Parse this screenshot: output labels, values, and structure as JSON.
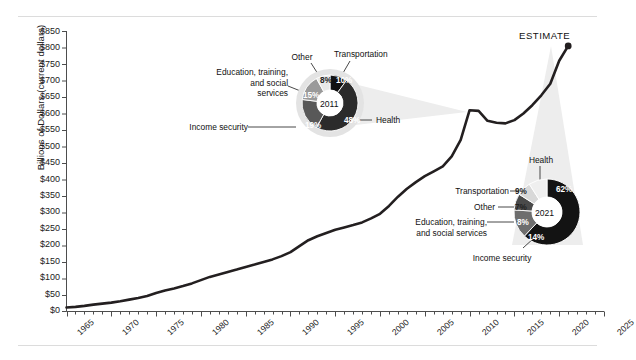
{
  "chart_data": {
    "type": "line",
    "title": "",
    "xlabel": "",
    "ylabel": "Billions of Dollars (current dollars)",
    "xlim": [
      1965,
      2025
    ],
    "ylim": [
      0,
      850
    ],
    "ytick_labels": [
      "$850",
      "$800",
      "$750",
      "$700",
      "$650",
      "$600",
      "$550",
      "$500",
      "$450",
      "$400",
      "$350",
      "$300",
      "$250",
      "$200",
      "$150",
      "$100",
      "$50",
      "$0"
    ],
    "ytick_values": [
      850,
      800,
      750,
      700,
      650,
      600,
      550,
      500,
      450,
      400,
      350,
      300,
      250,
      200,
      150,
      100,
      50,
      0
    ],
    "xtick_labels": [
      "1965",
      "1970",
      "1975",
      "1980",
      "1985",
      "1990",
      "1995",
      "2000",
      "2005",
      "2010",
      "2015",
      "2020",
      "2025"
    ],
    "xtick_values": [
      1965,
      1970,
      1975,
      1980,
      1985,
      1990,
      1995,
      2000,
      2005,
      2010,
      2015,
      2020,
      2025
    ],
    "grid": false,
    "legend": "none",
    "series": [
      {
        "name": "Total outlays",
        "x": [
          1965,
          1966,
          1967,
          1968,
          1969,
          1970,
          1971,
          1972,
          1973,
          1974,
          1975,
          1976,
          1977,
          1978,
          1979,
          1980,
          1981,
          1982,
          1983,
          1984,
          1985,
          1986,
          1987,
          1988,
          1989,
          1990,
          1991,
          1992,
          1993,
          1994,
          1995,
          1996,
          1997,
          1998,
          1999,
          2000,
          2001,
          2002,
          2003,
          2004,
          2005,
          2006,
          2007,
          2008,
          2009,
          2010,
          2011,
          2012,
          2013,
          2014,
          2015,
          2016,
          2017,
          2018,
          2019,
          2020,
          2021
        ],
        "values": [
          12,
          14,
          17,
          21,
          24,
          27,
          31,
          36,
          41,
          47,
          56,
          64,
          70,
          77,
          85,
          95,
          105,
          112,
          120,
          127,
          135,
          142,
          150,
          158,
          168,
          180,
          198,
          216,
          228,
          238,
          248,
          255,
          262,
          270,
          282,
          296,
          320,
          348,
          372,
          392,
          410,
          425,
          440,
          470,
          520,
          610,
          608,
          578,
          572,
          570,
          580,
          600,
          625,
          655,
          690,
          760,
          805
        ]
      }
    ],
    "annotations": [
      {
        "name": "estimate-label",
        "text": "ESTIMATE"
      }
    ],
    "donuts": [
      {
        "id": "donut-2011",
        "center_label": "2011",
        "slices": [
          {
            "label": "Health",
            "pct": 48,
            "pct_text": "48%",
            "color": "#2b2b2b"
          },
          {
            "label": "Income security",
            "pct": 19,
            "pct_text": "19%",
            "color": "#585858"
          },
          {
            "label": "Education, training, and social services",
            "pct": 15,
            "pct_text": "15%",
            "color": "#9a9a9a"
          },
          {
            "label": "Other",
            "pct": 8,
            "pct_text": "8%",
            "color": "#e8e8e8"
          },
          {
            "label": "Transportation",
            "pct": 10,
            "pct_text": "10%",
            "color": "#111111"
          }
        ]
      },
      {
        "id": "donut-2021",
        "center_label": "2021",
        "slices": [
          {
            "label": "Health",
            "pct": 62,
            "pct_text": "62%",
            "color": "#131313"
          },
          {
            "label": "Income security",
            "pct": 14,
            "pct_text": "14%",
            "color": "#6e6e6e"
          },
          {
            "label": "Education, training, and social services",
            "pct": 8,
            "pct_text": "8%",
            "color": "#4a4a4a"
          },
          {
            "label": "Other",
            "pct": 7,
            "pct_text": "7%",
            "color": "#d8d8d8"
          },
          {
            "label": "Transportation",
            "pct": 9,
            "pct_text": "9%",
            "color": "#efefef"
          }
        ]
      }
    ]
  },
  "axis": {
    "ylabel": "Billions of Dollars (current dollars)",
    "yticks": [
      "$850",
      "$800",
      "$750",
      "$700",
      "$650",
      "$600",
      "$550",
      "$500",
      "$450",
      "$400",
      "$350",
      "$300",
      "$250",
      "$200",
      "$150",
      "$100",
      "$50",
      "$0"
    ],
    "xticks": [
      "1965",
      "1970",
      "1975",
      "1980",
      "1985",
      "1990",
      "1995",
      "2000",
      "2005",
      "2010",
      "2015",
      "2020",
      "2025"
    ]
  },
  "estimate": {
    "label": "ESTIMATE"
  },
  "donut2011": {
    "year": "2011",
    "health_label": "Health",
    "health_pct": "48%",
    "income_label": "Income security",
    "income_pct": "19%",
    "education_line1": "Education, training,",
    "education_line2": "and social",
    "education_line3": "services",
    "education_pct": "15%",
    "other_label": "Other",
    "other_pct": "8%",
    "transport_label": "Transportation",
    "transport_pct": "10%"
  },
  "donut2021": {
    "year": "2021",
    "health_label": "Health",
    "health_pct": "62%",
    "income_label": "Income security",
    "income_pct": "14%",
    "education_line1": "Education, training,",
    "education_line2": "and social services",
    "education_pct": "8%",
    "other_label": "Other",
    "other_pct": "7%",
    "transport_label": "Transportation",
    "transport_pct": "9%"
  },
  "colors": {
    "line": "#231f20",
    "cone": "#ededed",
    "axis": "#4d4d4d",
    "rule": "#dcdcdc"
  }
}
